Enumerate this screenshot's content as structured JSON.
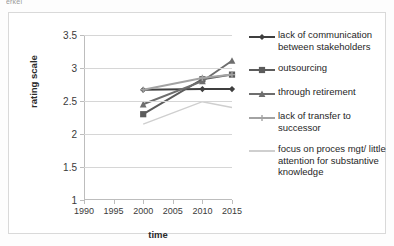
{
  "top_sliver_text": "erkel",
  "chart_data": {
    "type": "line",
    "title": "",
    "xlabel": "time",
    "ylabel": "rating scale",
    "x": [
      2000,
      2010,
      2015
    ],
    "xticks": [
      1990,
      1995,
      2000,
      2005,
      2010,
      2015
    ],
    "yticks": [
      1,
      1.5,
      2,
      2.5,
      3,
      3.5
    ],
    "xlim": [
      1990,
      2015
    ],
    "ylim": [
      1,
      3.5
    ],
    "grid": "horizontal",
    "legend_position": "right",
    "series": [
      {
        "name": "lack of communication between stakeholders",
        "values": [
          2.67,
          2.68,
          2.68
        ],
        "color": "#3f3f3f",
        "marker": "diamond"
      },
      {
        "name": "outsourcing",
        "values": [
          2.3,
          2.83,
          2.9
        ],
        "color": "#5c5c5c",
        "marker": "square"
      },
      {
        "name": "through retirement",
        "values": [
          2.45,
          2.8,
          3.11
        ],
        "color": "#6e6e6e",
        "marker": "triangle"
      },
      {
        "name": "lack of transfer to successor",
        "values": [
          2.67,
          2.85,
          2.9
        ],
        "color": "#a3a3a3",
        "marker": "cross"
      },
      {
        "name": "focus on proces mgt/ little attention for substantive knowledge",
        "values": [
          2.15,
          2.49,
          2.4
        ],
        "color": "#cfcfcf",
        "marker": "none"
      }
    ]
  },
  "legend": {
    "items": [
      {
        "label": "lack of communication between stakeholders"
      },
      {
        "label": "outsourcing"
      },
      {
        "label": "through retirement"
      },
      {
        "label": "lack of transfer to successor"
      },
      {
        "label": "focus on proces mgt/ little attention for substantive knowledge"
      }
    ]
  }
}
